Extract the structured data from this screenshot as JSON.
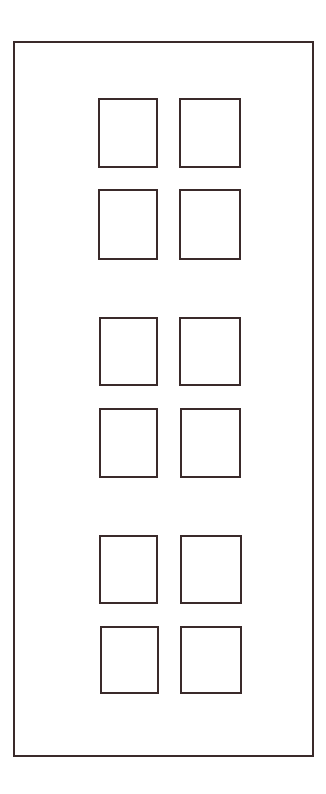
{
  "diagram": {
    "type": "door-panel-layout",
    "stroke_color": "#3a2a2a",
    "background": "#ffffff",
    "outer_frame": {
      "x": 13,
      "y": 41,
      "w": 301,
      "h": 716
    },
    "panel_groups": [
      {
        "rows": [
          [
            {
              "x": 98,
              "y": 98,
              "w": 60,
              "h": 70
            },
            {
              "x": 179,
              "y": 98,
              "w": 62,
              "h": 70
            }
          ],
          [
            {
              "x": 98,
              "y": 189,
              "w": 60,
              "h": 71
            },
            {
              "x": 179,
              "y": 189,
              "w": 62,
              "h": 71
            }
          ]
        ]
      },
      {
        "rows": [
          [
            {
              "x": 99,
              "y": 317,
              "w": 59,
              "h": 69
            },
            {
              "x": 179,
              "y": 317,
              "w": 62,
              "h": 69
            }
          ],
          [
            {
              "x": 99,
              "y": 408,
              "w": 59,
              "h": 70
            },
            {
              "x": 180,
              "y": 408,
              "w": 61,
              "h": 70
            }
          ]
        ]
      },
      {
        "rows": [
          [
            {
              "x": 99,
              "y": 535,
              "w": 59,
              "h": 69
            },
            {
              "x": 180,
              "y": 535,
              "w": 62,
              "h": 69
            }
          ],
          [
            {
              "x": 100,
              "y": 626,
              "w": 59,
              "h": 68
            },
            {
              "x": 180,
              "y": 626,
              "w": 62,
              "h": 68
            }
          ]
        ]
      }
    ]
  }
}
